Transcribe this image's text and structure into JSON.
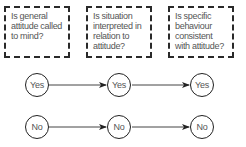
{
  "questions": [
    {
      "text": "Is general attitude called to mind?"
    },
    {
      "text": "Is situation interpreted in relation to attitude?"
    },
    {
      "text": "Is specific behaviour consistent with attitude?"
    }
  ],
  "rows": {
    "yes": [
      "Yes",
      "Yes",
      "Yes"
    ],
    "no": [
      "No",
      "No",
      "No"
    ]
  },
  "colors": {
    "stroke": "#222222",
    "text": "#555555",
    "background": "#ffffff"
  }
}
